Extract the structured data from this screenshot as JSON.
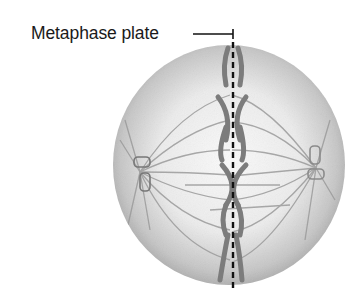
{
  "diagram": {
    "labels": [
      {
        "id": "metaphase-plate",
        "text": "Metaphase plate"
      }
    ],
    "colors": {
      "cell_fill_light": "#f4f4f4",
      "cell_fill_dark": "#a8a8a8",
      "chromosome": "#7a7a7a",
      "spindle": "#9a9a9a",
      "dashed_line": "#111111",
      "label_text": "#1a1a1a"
    }
  }
}
